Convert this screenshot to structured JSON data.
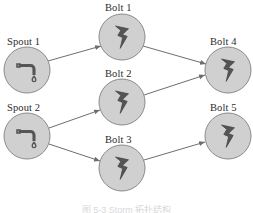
{
  "figure": {
    "type": "directed-graph",
    "title": "",
    "caption": "图 5-3  Storm 拓扑结构",
    "background_color": "#ffffff",
    "node_fill_color": "#d0d0d0",
    "node_stroke_color": "#8a8a8a",
    "edge_color": "#6e6e6e",
    "label_color": "#2b2b2b",
    "icon_color": "#555555"
  },
  "nodes": [
    {
      "id": "spout-1",
      "label": "Spout 1",
      "kind": "spout",
      "icon": "faucet-drop-icon",
      "cx": 27,
      "cy": 70,
      "r": 23,
      "label_x": 7,
      "label_y": 36
    },
    {
      "id": "spout-2",
      "label": "Spout 2",
      "kind": "spout",
      "icon": "faucet-drop-icon",
      "cx": 27,
      "cy": 136,
      "r": 23,
      "label_x": 7,
      "label_y": 102
    },
    {
      "id": "bolt-1",
      "label": "Bolt 1",
      "kind": "bolt",
      "icon": "lightning-bolt-icon",
      "cx": 122,
      "cy": 37,
      "r": 23,
      "label_x": 105,
      "label_y": 2
    },
    {
      "id": "bolt-2",
      "label": "Bolt 2",
      "kind": "bolt",
      "icon": "lightning-bolt-icon",
      "cx": 122,
      "cy": 102,
      "r": 23,
      "label_x": 105,
      "label_y": 68
    },
    {
      "id": "bolt-3",
      "label": "Bolt 3",
      "kind": "bolt",
      "icon": "lightning-bolt-icon",
      "cx": 122,
      "cy": 168,
      "r": 23,
      "label_x": 105,
      "label_y": 134
    },
    {
      "id": "bolt-4",
      "label": "Bolt 4",
      "kind": "bolt",
      "icon": "lightning-bolt-icon",
      "cx": 228,
      "cy": 70,
      "r": 23,
      "label_x": 210,
      "label_y": 36
    },
    {
      "id": "bolt-5",
      "label": "Bolt 5",
      "kind": "bolt",
      "icon": "lightning-bolt-icon",
      "cx": 228,
      "cy": 136,
      "r": 23,
      "label_x": 210,
      "label_y": 102
    }
  ],
  "edges": [
    {
      "id": "edge-spout1-bolt1",
      "from": "spout-1",
      "to": "bolt-1",
      "x1": 48,
      "y1": 61,
      "x2": 101,
      "y2": 46
    },
    {
      "id": "edge-spout2-bolt2",
      "from": "spout-2",
      "to": "bolt-2",
      "x1": 49,
      "y1": 128,
      "x2": 100,
      "y2": 110
    },
    {
      "id": "edge-spout2-bolt3",
      "from": "spout-2",
      "to": "bolt-3",
      "x1": 49,
      "y1": 144,
      "x2": 100,
      "y2": 161
    },
    {
      "id": "edge-bolt1-bolt4",
      "from": "bolt-1",
      "to": "bolt-4",
      "x1": 143,
      "y1": 46,
      "x2": 206,
      "y2": 64
    },
    {
      "id": "edge-bolt2-bolt4",
      "from": "bolt-2",
      "to": "bolt-4",
      "x1": 144,
      "y1": 95,
      "x2": 205,
      "y2": 75
    },
    {
      "id": "edge-bolt3-bolt5",
      "from": "bolt-3",
      "to": "bolt-5",
      "x1": 144,
      "y1": 160,
      "x2": 205,
      "y2": 142
    }
  ]
}
